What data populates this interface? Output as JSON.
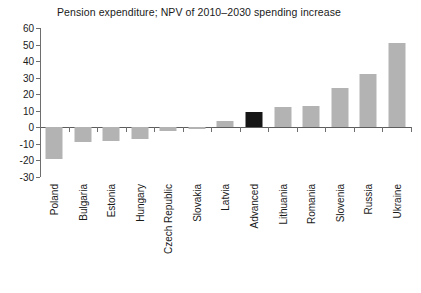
{
  "chart_data": {
    "type": "bar",
    "title": "Pension expenditure; NPV of 2010–2030 spending increase",
    "xlabel": "",
    "ylabel": "",
    "ylim": [
      -30,
      60
    ],
    "ytick_step": 10,
    "yticks": [
      60,
      50,
      40,
      30,
      20,
      10,
      0,
      -10,
      -20,
      -30
    ],
    "ytick_labels": [
      "60",
      "50",
      "40",
      "30",
      "20",
      "10",
      "0",
      "-10",
      "-20",
      "-30"
    ],
    "grid": false,
    "legend": null,
    "categories": [
      "Poland",
      "Bulgaria",
      "Estonia",
      "Hungary",
      "Czech Republic",
      "Slovakia",
      "Latvia",
      "Advanced",
      "Lithuania",
      "Romania",
      "Slovenia",
      "Russia",
      "Ukraine"
    ],
    "values": [
      -19,
      -9,
      -8,
      -7,
      -2,
      -1,
      4,
      9,
      12,
      13,
      24,
      32,
      51
    ],
    "highlight_category": "Advanced",
    "colors": {
      "bar": "#b3b3b3",
      "bar_highlight": "#161616",
      "axis": "#6e6e6e",
      "text": "#1a1a1a",
      "background": "#ffffff"
    }
  }
}
